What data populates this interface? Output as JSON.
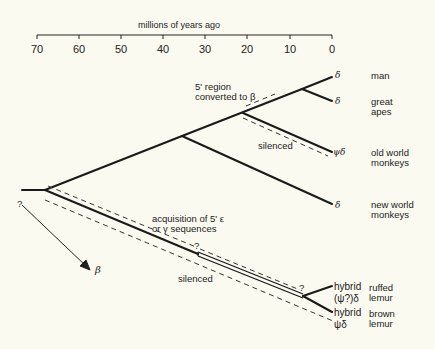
{
  "axis": {
    "title": "millions of years ago",
    "ticks": [
      "70",
      "60",
      "50",
      "40",
      "30",
      "20",
      "10",
      "0"
    ]
  },
  "taxa": {
    "man": {
      "name": "man",
      "gene": "δ"
    },
    "great_apes": {
      "name": "great\napes",
      "gene": "δ"
    },
    "old_world": {
      "name": "old world\nmonkeys",
      "gene": "ψδ"
    },
    "new_world": {
      "name": "new world\nmonkeys",
      "gene": "δ"
    },
    "ruffed_lemur": {
      "name": "ruffed\nlemur",
      "gene": "hybrid\n(ψ?)δ"
    },
    "brown_lemur": {
      "name": "brown\nlemur",
      "gene": "hybrid\nψδ"
    }
  },
  "annotations": {
    "converted": "5' region\nconverted to β",
    "silenced_upper": "silenced",
    "acquisition": "acquisition of 5' ε\nor γ sequences",
    "silenced_lower": "silenced",
    "q_root": "?",
    "q_mid": "?",
    "q_end": "?",
    "beta": "β"
  }
}
